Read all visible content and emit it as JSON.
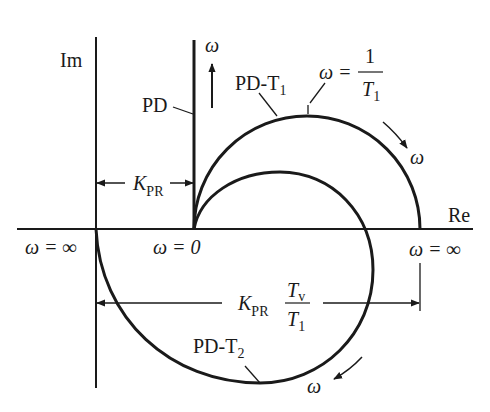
{
  "diagram": {
    "colors": {
      "ink": "#1a1a1a",
      "background": "#ffffff"
    },
    "axes": {
      "imag_label": "Im",
      "real_label": "Re"
    },
    "curves": {
      "pd": {
        "label": "PD"
      },
      "pd_t1": {
        "label": "PD-T",
        "sub": "1"
      },
      "pd_t2": {
        "label": "PD-T",
        "sub": "2"
      }
    },
    "annotations": {
      "omega_up": "ω",
      "omega_outer_arrow": "ω",
      "omega_bottom_arrow": "ω",
      "omega_peak": {
        "lhs": "ω = ",
        "num": "1",
        "den": "T",
        "den_sub": "1"
      },
      "omega_zero": "ω = 0",
      "omega_inf_left": "ω = ∞",
      "omega_inf_right": "ω = ∞",
      "kpr": {
        "main": "K",
        "sub": "PR"
      },
      "kpr_ratio": {
        "main": "K",
        "sub": "PR",
        "num": "T",
        "num_sub": "v",
        "den": "T",
        "den_sub": "1"
      }
    }
  }
}
